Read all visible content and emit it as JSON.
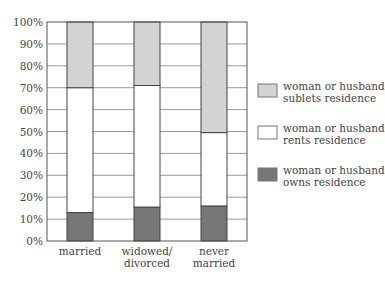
{
  "chart_data": {
    "type": "bar",
    "stacked": true,
    "title": "",
    "xlabel": "",
    "ylabel": "",
    "ylim": [
      0,
      100
    ],
    "y_ticks": [
      "0%",
      "10%",
      "20%",
      "30%",
      "40%",
      "50%",
      "60%",
      "70%",
      "80%",
      "90%",
      "100%"
    ],
    "grid": true,
    "categories": [
      [
        "married"
      ],
      [
        "widowed/",
        "divorced"
      ],
      [
        "never",
        "married"
      ]
    ],
    "series": [
      {
        "name": "woman or husband owns residence",
        "legend_lines": [
          "woman or husband",
          "owns residence"
        ],
        "color": "#777777",
        "values": [
          13,
          15.5,
          16
        ]
      },
      {
        "name": "woman or husband rents residence",
        "legend_lines": [
          "woman or husband",
          "rents residence"
        ],
        "color": "#ffffff",
        "values": [
          57,
          55.5,
          33.5
        ]
      },
      {
        "name": "woman or husband sublets residence",
        "legend_lines": [
          "woman or husband",
          "sublets residence"
        ],
        "color": "#d3d3d3",
        "values": [
          30,
          29,
          50.5
        ]
      }
    ],
    "legend_position": "right",
    "legend_order": [
      2,
      1,
      0
    ]
  }
}
